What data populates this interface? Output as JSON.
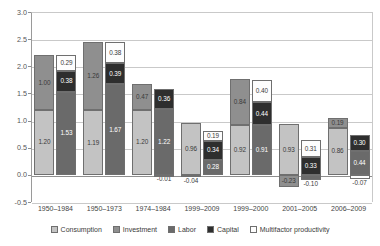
{
  "chart_data": {
    "type": "bar",
    "title": "",
    "subtitle": "",
    "xlabel": "",
    "ylabel": "",
    "ylim": [
      -0.5,
      3.0
    ],
    "ytick_labels": [
      "3.0",
      "2.5",
      "2.0",
      "1.5",
      "1.0",
      "0.5",
      "0.0",
      "-0.5"
    ],
    "ytick_values": [
      3.0,
      2.5,
      2.0,
      1.5,
      1.0,
      0.5,
      0.0,
      -0.5
    ],
    "grid": true,
    "stacked": true,
    "legend_position": "bottom",
    "categories": [
      "1950–1984",
      "1950–1973",
      "1974–1984",
      "1999–2009",
      "1999–2000",
      "2001–2005",
      "2006–2009"
    ],
    "legend": [
      {
        "name": "Consumption",
        "color": "#c3c3c3"
      },
      {
        "name": "Investment",
        "color": "#8f8f8f"
      },
      {
        "name": "Labor",
        "color": "#6a6a6a"
      },
      {
        "name": "Capital",
        "color": "#2e2e2e"
      },
      {
        "name": "Multifactor productivity",
        "color": "#fdfdfd"
      }
    ],
    "series": [
      {
        "name": "Consumption",
        "color": "#c3c3c3",
        "bar": "left",
        "values": [
          1.2,
          1.19,
          1.2,
          0.96,
          0.92,
          0.93,
          0.86
        ]
      },
      {
        "name": "Investment",
        "color": "#8f8f8f",
        "bar": "left",
        "values": [
          1.0,
          1.26,
          0.47,
          -0.04,
          0.84,
          -0.23,
          0.19
        ]
      },
      {
        "name": "Labor",
        "color": "#6a6a6a",
        "bar": "right",
        "values": [
          1.53,
          1.67,
          1.22,
          0.28,
          0.91,
          -0.1,
          0.44
        ]
      },
      {
        "name": "Capital",
        "color": "#2e2e2e",
        "bar": "right",
        "values": [
          0.38,
          0.39,
          0.36,
          0.34,
          0.44,
          0.33,
          0.3
        ]
      },
      {
        "name": "Multifactor productivity",
        "color": "#fdfdfd",
        "bar": "right",
        "values": [
          0.29,
          0.38,
          -0.01,
          0.19,
          0.4,
          0.31,
          -0.07
        ]
      }
    ]
  }
}
